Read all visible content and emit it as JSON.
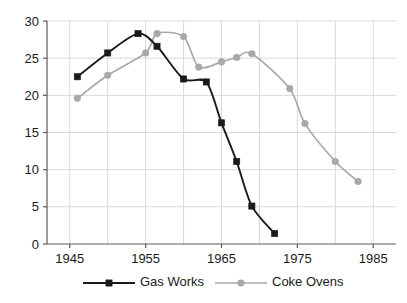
{
  "chart_data": {
    "type": "line",
    "title": "",
    "subtitle": "",
    "xlabel": "",
    "ylabel": "",
    "xlim": [
      1942,
      1988
    ],
    "ylim": [
      0,
      30
    ],
    "grid": true,
    "legend_position": "bottom",
    "x_ticks": [
      1945,
      1955,
      1965,
      1975,
      1985
    ],
    "x_tick_labels": [
      "1945",
      "1955",
      "1965",
      "1975",
      "1985"
    ],
    "x_minor_gridlines": [
      1945,
      1950,
      1955,
      1960,
      1965,
      1970,
      1975,
      1980,
      1985
    ],
    "y_ticks": [
      0,
      5,
      10,
      15,
      20,
      25,
      30
    ],
    "y_tick_labels": [
      "0",
      "5",
      "10",
      "15",
      "20",
      "25",
      "30"
    ],
    "series": [
      {
        "name": "Gas Works",
        "color": "#1a1a1a",
        "marker": "square",
        "x": [
          1946,
          1950,
          1954,
          1956.5,
          1960,
          1963,
          1965,
          1967,
          1969,
          1972
        ],
        "values": [
          22.5,
          25.7,
          28.3,
          26.6,
          22.2,
          21.8,
          16.3,
          11.1,
          5.1,
          1.4
        ]
      },
      {
        "name": "Coke Ovens",
        "color": "#a8a8a8",
        "marker": "circle",
        "x": [
          1946,
          1950,
          1955,
          1956.5,
          1960,
          1962,
          1965,
          1967,
          1969,
          1974,
          1976,
          1980,
          1983
        ],
        "values": [
          19.6,
          22.7,
          25.7,
          28.3,
          27.9,
          23.8,
          24.5,
          25.1,
          25.6,
          20.9,
          16.2,
          11.1,
          8.4
        ]
      }
    ]
  },
  "legend": {
    "items": [
      {
        "label": "Gas Works"
      },
      {
        "label": "Coke Ovens"
      }
    ]
  },
  "colors": {
    "gas_works": "#1a1a1a",
    "coke_ovens": "#a8a8a8",
    "axis": "#5a5a5a",
    "grid": "#d9d9d9",
    "background": "#ffffff",
    "text": "#1a1a1a"
  }
}
